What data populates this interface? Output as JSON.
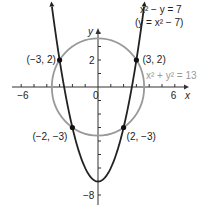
{
  "chart_data": {
    "type": "line",
    "title": "",
    "xlabel": "x",
    "ylabel": "y",
    "xlim": [
      -6.5,
      7.5
    ],
    "ylim": [
      -9,
      6.5
    ],
    "x_ticks": [
      -6,
      -5,
      -4,
      -3,
      -2,
      -1,
      1,
      2,
      3,
      4,
      5,
      6
    ],
    "x_tick_labels": [
      {
        "value": -6,
        "label": "−6"
      },
      {
        "value": 0,
        "label": "0"
      },
      {
        "value": 6,
        "label": "6"
      }
    ],
    "y_ticks": [
      -8,
      -7,
      -6,
      -5,
      -4,
      -3,
      -2,
      -1,
      1,
      2,
      3,
      4
    ],
    "y_tick_labels": [
      {
        "value": 2,
        "label": "2"
      },
      {
        "value": -8,
        "label": "−8"
      }
    ],
    "series": [
      {
        "name": "x² − y = 7 (y = x² − 7)",
        "kind": "parabola",
        "equation": "y = x^2 - 7",
        "color": "#222222",
        "x_range": [
          -3.6,
          3.6
        ]
      },
      {
        "name": "x² + y² = 13",
        "kind": "circle",
        "center": [
          0,
          0
        ],
        "radius_units": 3.606,
        "color": "#999999"
      }
    ],
    "points": [
      {
        "x": -3,
        "y": 2,
        "label": "(−3, 2)"
      },
      {
        "x": 3,
        "y": 2,
        "label": "(3, 2)"
      },
      {
        "x": -2,
        "y": -3,
        "label": "(−2, −3)"
      },
      {
        "x": 2,
        "y": -3,
        "label": "(2, −3)"
      }
    ],
    "annotations": {
      "parabola_eq_line1": "x² − y = 7",
      "parabola_eq_line2": "(y = x² − 7)",
      "circle_eq": "x² + y² = 13"
    }
  }
}
